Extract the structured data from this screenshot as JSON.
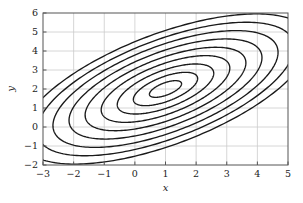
{
  "figure": {
    "background_color": "#ffffff",
    "axes_color": "#555555",
    "grid_color": "#cccccc",
    "contour_color": "#1a1a1a"
  },
  "chart_data": {
    "type": "line",
    "subtype": "contour",
    "title": "",
    "subtitle": "",
    "xlabel": "x",
    "ylabel": "y",
    "xlim": [
      -3,
      5
    ],
    "ylim": [
      -2,
      6
    ],
    "xticks": [
      -3,
      -2,
      -1,
      0,
      1,
      2,
      3,
      4,
      5
    ],
    "xtick_labels": [
      "−3",
      "−2",
      "−1",
      "0",
      "1",
      "2",
      "3",
      "4",
      "5"
    ],
    "yticks": [
      -2,
      -1,
      0,
      1,
      2,
      3,
      4,
      5,
      6
    ],
    "ytick_labels": [
      "−2",
      "−1",
      "0",
      "1",
      "2",
      "3",
      "4",
      "5",
      "6"
    ],
    "grid": true,
    "legend": null,
    "legend_position": "none",
    "annotations": [],
    "center": [
      1.0,
      2.0
    ],
    "rotation_deg": 37,
    "n_contours": 9,
    "series": [
      {
        "name": "contour-1",
        "level": 1,
        "semi_major": 0.62,
        "semi_minor": 0.29
      },
      {
        "name": "contour-2",
        "level": 2,
        "semi_major": 1.24,
        "semi_minor": 0.58
      },
      {
        "name": "contour-3",
        "level": 3,
        "semi_major": 1.86,
        "semi_minor": 0.87
      },
      {
        "name": "contour-4",
        "level": 4,
        "semi_major": 2.48,
        "semi_minor": 1.16
      },
      {
        "name": "contour-5",
        "level": 5,
        "semi_major": 3.1,
        "semi_minor": 1.45
      },
      {
        "name": "contour-6",
        "level": 6,
        "semi_major": 3.72,
        "semi_minor": 1.74
      },
      {
        "name": "contour-7",
        "level": 7,
        "semi_major": 4.34,
        "semi_minor": 2.03
      },
      {
        "name": "contour-8",
        "level": 8,
        "semi_major": 4.96,
        "semi_minor": 2.32
      },
      {
        "name": "contour-9",
        "level": 9,
        "semi_major": 5.58,
        "semi_minor": 2.61
      }
    ]
  }
}
